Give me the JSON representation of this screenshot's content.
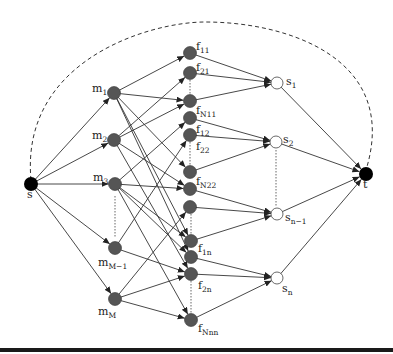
{
  "diagram": {
    "type": "flow-network",
    "source": {
      "id": "s",
      "label": "s",
      "x": 31,
      "y": 184
    },
    "sink": {
      "id": "t",
      "label": "t",
      "x": 366,
      "y": 174
    },
    "machines": [
      {
        "id": "m1",
        "base": "m",
        "sub": "1",
        "x": 114,
        "y": 93,
        "lx": 92,
        "ly": 92
      },
      {
        "id": "m2",
        "base": "m",
        "sub": "2",
        "x": 114,
        "y": 140,
        "lx": 92,
        "ly": 139
      },
      {
        "id": "m3",
        "base": "m",
        "sub": "3",
        "x": 115,
        "y": 184,
        "lx": 93,
        "ly": 181
      },
      {
        "id": "mM-1",
        "base": "m",
        "sub": "M−1",
        "x": 115,
        "y": 248,
        "lx": 98,
        "ly": 266
      },
      {
        "id": "mM",
        "base": "m",
        "sub": "M",
        "x": 115,
        "y": 299,
        "lx": 98,
        "ly": 315
      }
    ],
    "f_nodes": [
      {
        "id": "f11",
        "base": "f",
        "sub": "11",
        "x": 190,
        "y": 53,
        "lx": 196,
        "ly": 50
      },
      {
        "id": "f21",
        "base": "f",
        "sub": "21",
        "x": 190,
        "y": 73,
        "lx": 196,
        "ly": 71
      },
      {
        "id": "fN11",
        "base": "f",
        "sub": "N11",
        "x": 190,
        "y": 101,
        "lx": 196,
        "ly": 114
      },
      {
        "id": "f12",
        "base": "f",
        "sub": "12",
        "x": 190,
        "y": 118,
        "lx": 196,
        "ly": 133
      },
      {
        "id": "f22",
        "base": "f",
        "sub": "22",
        "x": 190,
        "y": 135,
        "lx": 196,
        "ly": 150
      },
      {
        "id": "fN22",
        "base": "f",
        "sub": "N22",
        "x": 190,
        "y": 172,
        "lx": 196,
        "ly": 185
      },
      {
        "id": "fa",
        "base": "",
        "sub": "",
        "x": 190,
        "y": 189,
        "lx": 0,
        "ly": 0
      },
      {
        "id": "fb",
        "base": "",
        "sub": "",
        "x": 190,
        "y": 207,
        "lx": 0,
        "ly": 0
      },
      {
        "id": "f1n",
        "base": "f",
        "sub": "1n",
        "x": 191,
        "y": 241,
        "lx": 198,
        "ly": 252
      },
      {
        "id": "fc",
        "base": "",
        "sub": "",
        "x": 191,
        "y": 257,
        "lx": 0,
        "ly": 0
      },
      {
        "id": "f2n",
        "base": "f",
        "sub": "2n",
        "x": 191,
        "y": 274,
        "lx": 198,
        "ly": 289
      },
      {
        "id": "fNnn",
        "base": "f",
        "sub": "Nnn",
        "x": 191,
        "y": 320,
        "lx": 198,
        "ly": 332
      }
    ],
    "sinks_s": [
      {
        "id": "s1",
        "base": "s",
        "sub": "1",
        "x": 277,
        "y": 83,
        "lx": 286,
        "ly": 85
      },
      {
        "id": "s2",
        "base": "s",
        "sub": "2",
        "x": 276,
        "y": 142,
        "lx": 283,
        "ly": 143
      },
      {
        "id": "sn-1",
        "base": "s",
        "sub": "n−1",
        "x": 277,
        "y": 214,
        "lx": 285,
        "ly": 221
      },
      {
        "id": "sn",
        "base": "s",
        "sub": "n",
        "x": 277,
        "y": 278,
        "lx": 282,
        "ly": 292
      }
    ],
    "edges": [
      [
        "s",
        "m1"
      ],
      [
        "s",
        "m2"
      ],
      [
        "s",
        "m3"
      ],
      [
        "s",
        "mM-1"
      ],
      [
        "s",
        "mM"
      ],
      [
        "m1",
        "f11"
      ],
      [
        "m1",
        "fN11"
      ],
      [
        "m1",
        "fN22"
      ],
      [
        "m1",
        "f1n"
      ],
      [
        "m1",
        "fc"
      ],
      [
        "m2",
        "f21"
      ],
      [
        "m2",
        "fN11"
      ],
      [
        "m2",
        "fa"
      ],
      [
        "m2",
        "f2n"
      ],
      [
        "m3",
        "f12"
      ],
      [
        "m3",
        "fa"
      ],
      [
        "m3",
        "f1n"
      ],
      [
        "m3",
        "fc"
      ],
      [
        "m3",
        "fNnn"
      ],
      [
        "mM-1",
        "f22"
      ],
      [
        "mM-1",
        "f2n"
      ],
      [
        "mM",
        "fb"
      ],
      [
        "mM",
        "f2n"
      ],
      [
        "mM",
        "fNnn"
      ],
      [
        "f11",
        "s1"
      ],
      [
        "f21",
        "s1"
      ],
      [
        "fN11",
        "s1"
      ],
      [
        "f12",
        "s2"
      ],
      [
        "f22",
        "s2"
      ],
      [
        "fN22",
        "s2"
      ],
      [
        "fa",
        "sn-1"
      ],
      [
        "fb",
        "sn-1"
      ],
      [
        "f1n",
        "sn-1"
      ],
      [
        "fc",
        "sn"
      ],
      [
        "f2n",
        "sn"
      ],
      [
        "fNnn",
        "sn"
      ],
      [
        "s1",
        "t"
      ],
      [
        "s2",
        "t"
      ],
      [
        "sn-1",
        "t"
      ],
      [
        "sn",
        "t"
      ]
    ],
    "dotted_ellipses": [
      {
        "x1": 115,
        "y1": 196,
        "x2": 115,
        "y2": 238
      },
      {
        "x1": 190,
        "y1": 80,
        "x2": 190,
        "y2": 95
      },
      {
        "x1": 190,
        "y1": 142,
        "x2": 190,
        "y2": 166
      },
      {
        "x1": 191,
        "y1": 214,
        "x2": 191,
        "y2": 235
      },
      {
        "x1": 191,
        "y1": 281,
        "x2": 191,
        "y2": 314
      },
      {
        "x1": 276,
        "y1": 150,
        "x2": 276,
        "y2": 207
      }
    ],
    "return_arc": {
      "path": "M 31 180 C 20 60, 150 22, 205 22 C 290 22, 400 60, 366 170",
      "style": "dashed"
    },
    "colors": {
      "machine": "#555555",
      "f_node": "#555555",
      "s_node": "#ffffff",
      "terminal": "#000000",
      "edge": "#333333"
    }
  }
}
